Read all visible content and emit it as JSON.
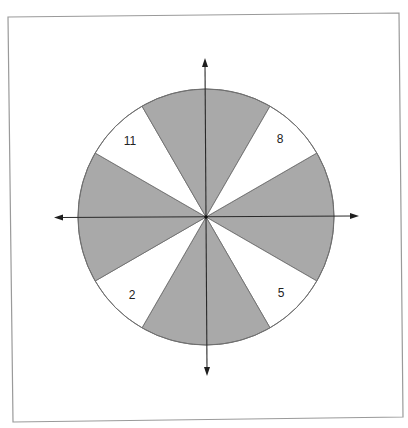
{
  "figure": {
    "colors": {
      "background": "#ffffff",
      "frame": "#9a9a9a",
      "shaded_sector": "#a9a9a9",
      "white_sector": "#ffffff",
      "outline": "#6f6f6f",
      "axis": "#2a2a2a"
    },
    "center": {
      "x": 206,
      "y": 217
    },
    "radius": 128,
    "sectors": [
      {
        "id": "shaded-right",
        "type": "shaded",
        "start_deg": -30,
        "end_deg": 30,
        "label": ""
      },
      {
        "id": "white-lower-right",
        "type": "white",
        "start_deg": 30,
        "end_deg": 60,
        "label": "5"
      },
      {
        "id": "shaded-bottom",
        "type": "shaded",
        "start_deg": 60,
        "end_deg": 120,
        "label": ""
      },
      {
        "id": "white-lower-left",
        "type": "white",
        "start_deg": 120,
        "end_deg": 150,
        "label": "2"
      },
      {
        "id": "shaded-left",
        "type": "shaded",
        "start_deg": 150,
        "end_deg": 210,
        "label": ""
      },
      {
        "id": "white-upper-left",
        "type": "white",
        "start_deg": 210,
        "end_deg": 240,
        "label": "11"
      },
      {
        "id": "shaded-top",
        "type": "shaded",
        "start_deg": 240,
        "end_deg": 300,
        "label": ""
      },
      {
        "id": "white-upper-right",
        "type": "white",
        "start_deg": 300,
        "end_deg": 330,
        "label": "8"
      }
    ],
    "labels": {
      "upper_left": "11",
      "upper_right": "8",
      "lower_left": "2",
      "lower_right": "5"
    },
    "axes": {
      "horizontal": {
        "x1": 54,
        "x2": 358,
        "y": 217
      },
      "vertical": {
        "x": 206,
        "y1": 58,
        "y2": 376
      }
    }
  }
}
